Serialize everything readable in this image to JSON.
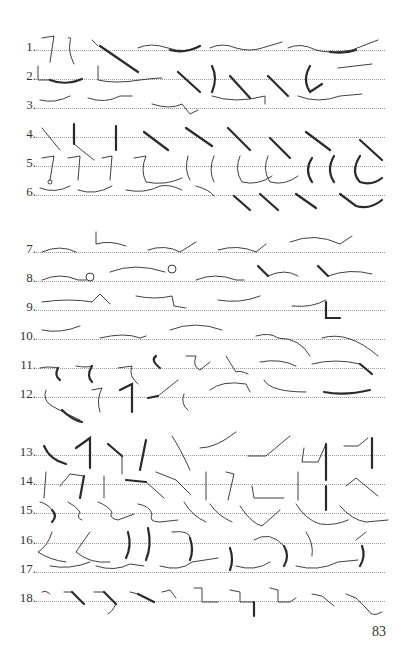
{
  "page": {
    "page_number": "83",
    "sections": [
      {
        "name": "section-1",
        "rows": [
          {
            "label": "1.",
            "y": 50
          },
          {
            "label": "2.",
            "y": 79
          },
          {
            "label": "3.",
            "y": 108
          },
          {
            "label": "4.",
            "y": 137
          },
          {
            "label": "5.",
            "y": 166
          },
          {
            "label": "6.",
            "y": 195
          }
        ]
      },
      {
        "name": "section-2",
        "rows": [
          {
            "label": "7.",
            "y": 252
          },
          {
            "label": "8.",
            "y": 281
          },
          {
            "label": "9.",
            "y": 310
          },
          {
            "label": "10.",
            "y": 339
          },
          {
            "label": "11.",
            "y": 368
          },
          {
            "label": "12.",
            "y": 397
          }
        ]
      },
      {
        "name": "section-3",
        "rows": [
          {
            "label": "13.",
            "y": 455
          },
          {
            "label": "14.",
            "y": 484
          },
          {
            "label": "15.",
            "y": 513
          },
          {
            "label": "16.",
            "y": 543
          },
          {
            "label": "17.",
            "y": 572
          },
          {
            "label": "18.",
            "y": 601
          }
        ]
      }
    ],
    "content_type": "shorthand-outlines"
  }
}
